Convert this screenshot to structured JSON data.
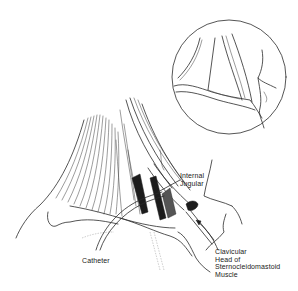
{
  "figure": {
    "colors": {
      "background": "#ffffff",
      "ink": "#2a2a2a",
      "shade": "#1c1c1c"
    }
  },
  "labels": {
    "internal_jugular": "Internal\nJugular",
    "clavicular_head": "Clavicular\nHead of\nSternocleidomastoid\nMuscle",
    "catheter": "Catheter"
  },
  "inset": {
    "shape": "circle",
    "center": [
      229,
      77
    ],
    "radius": 57
  }
}
